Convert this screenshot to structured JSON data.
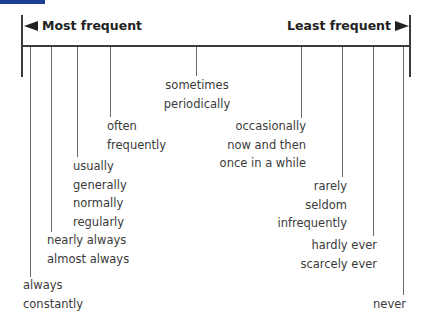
{
  "header": {
    "left_label": "Most frequent",
    "right_label": "Least frequent",
    "left_arrow_icon": "arrow-left-icon",
    "right_arrow_icon": "arrow-right-icon"
  },
  "colors": {
    "top_bar": "#1c3f94",
    "line": "#3a3a3a",
    "text": "#3a3a3a"
  },
  "groups": [
    {
      "id": "always",
      "words": [
        "always",
        "constantly"
      ]
    },
    {
      "id": "nearly-always",
      "words": [
        "nearly always",
        "almost always"
      ]
    },
    {
      "id": "usually",
      "words": [
        "usually",
        "generally",
        "normally",
        "regularly"
      ]
    },
    {
      "id": "often",
      "words": [
        "often",
        "frequently"
      ]
    },
    {
      "id": "sometimes",
      "words": [
        "sometimes",
        "periodically"
      ]
    },
    {
      "id": "occasionally",
      "words": [
        "occasionally",
        "now and then",
        "once in a while"
      ]
    },
    {
      "id": "rarely",
      "words": [
        "rarely",
        "seldom",
        "infrequently"
      ]
    },
    {
      "id": "hardly-ever",
      "words": [
        "hardly ever",
        "scarcely ever"
      ]
    },
    {
      "id": "never",
      "words": [
        "never"
      ]
    }
  ]
}
